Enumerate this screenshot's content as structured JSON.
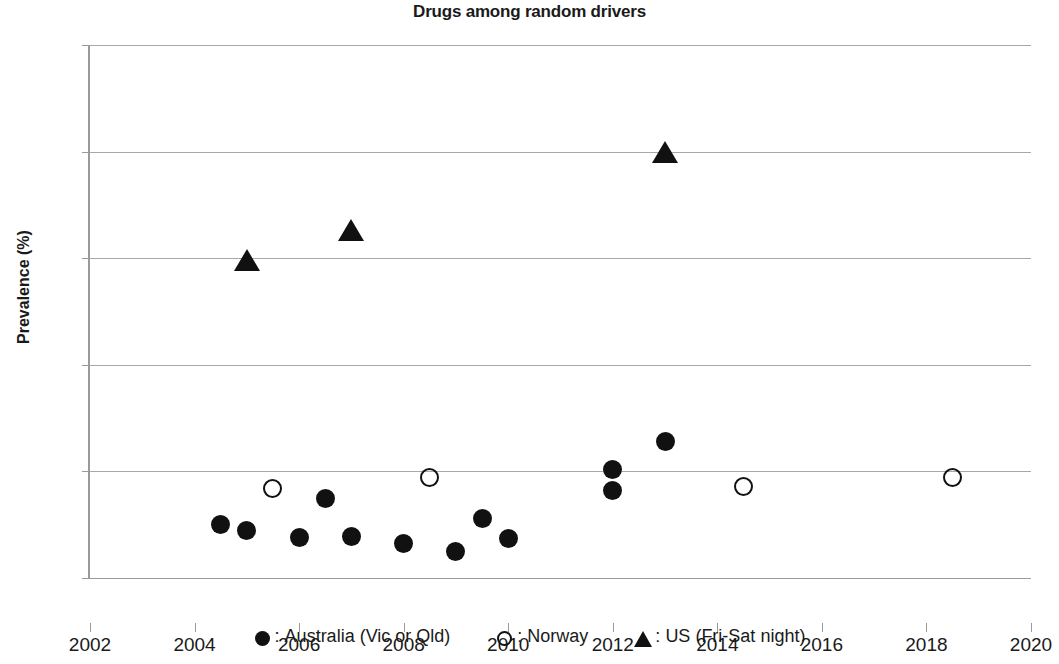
{
  "chart_data": {
    "type": "scatter",
    "title": "Drugs among random drivers",
    "xlabel": "",
    "ylabel": "Prevalence (%)",
    "xlim": [
      2002,
      2020
    ],
    "ylim": [
      0,
      25
    ],
    "x_ticks": [
      2002,
      2004,
      2006,
      2008,
      2010,
      2012,
      2014,
      2016,
      2018,
      2020
    ],
    "y_ticks": [
      0,
      5,
      10,
      15,
      20,
      25
    ],
    "grid": "horizontal",
    "legend_position": "bottom",
    "series": [
      {
        "name": "Australia (Vic or Qld)",
        "marker": "filled-circle",
        "color": "#111111",
        "points": [
          {
            "x": 2004.5,
            "y": 2.5
          },
          {
            "x": 2005.0,
            "y": 2.25
          },
          {
            "x": 2006.0,
            "y": 1.9
          },
          {
            "x": 2006.5,
            "y": 3.75
          },
          {
            "x": 2007.0,
            "y": 1.95
          },
          {
            "x": 2008.0,
            "y": 1.6
          },
          {
            "x": 2009.0,
            "y": 1.25
          },
          {
            "x": 2009.5,
            "y": 2.8
          },
          {
            "x": 2010.0,
            "y": 1.85
          },
          {
            "x": 2012.0,
            "y": 5.1
          },
          {
            "x": 2012.0,
            "y": 4.1
          },
          {
            "x": 2013.0,
            "y": 6.4
          }
        ]
      },
      {
        "name": "Norway",
        "marker": "open-circle",
        "color": "#111111",
        "points": [
          {
            "x": 2005.5,
            "y": 4.2
          },
          {
            "x": 2008.5,
            "y": 4.7
          },
          {
            "x": 2014.5,
            "y": 4.3
          },
          {
            "x": 2018.5,
            "y": 4.7
          }
        ]
      },
      {
        "name": "US (Fri-Sat night)",
        "marker": "filled-triangle",
        "color": "#111111",
        "points": [
          {
            "x": 2005.0,
            "y": 14.9
          },
          {
            "x": 2007.0,
            "y": 16.3
          },
          {
            "x": 2013.0,
            "y": 20.0
          }
        ]
      }
    ]
  },
  "legend": {
    "entries": [
      {
        "separator": ":",
        "label": "Australia (Vic or Qld)",
        "glyph": "filled-circle-icon"
      },
      {
        "separator": ":",
        "label": "Norway",
        "glyph": "open-circle-icon"
      },
      {
        "separator": ":",
        "label": "US (Fri-Sat night)",
        "glyph": "filled-triangle-icon"
      }
    ]
  }
}
